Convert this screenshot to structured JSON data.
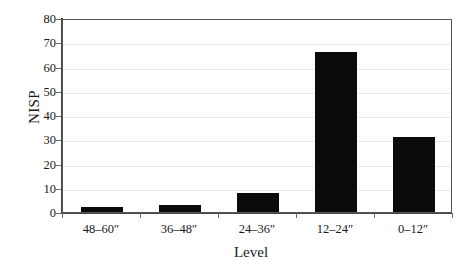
{
  "chart_data": {
    "type": "bar",
    "title": "",
    "xlabel": "Level",
    "ylabel": "NISP",
    "categories": [
      "48–60″",
      "36–48″",
      "24–36″",
      "12–24″",
      "0–12″"
    ],
    "values": [
      2,
      3,
      8,
      66,
      31
    ],
    "ylim": [
      0,
      80
    ],
    "ytick_labels": [
      "0",
      "10",
      "20",
      "30",
      "40",
      "50",
      "60",
      "70",
      "80"
    ],
    "ytick_values": [
      0,
      10,
      20,
      30,
      40,
      50,
      60,
      70,
      80
    ],
    "grid": true,
    "legend": false,
    "bar_color": "#0b0b0b",
    "grid_color": "#e9e9e9",
    "axis_color": "#4a4a4a",
    "background_color": "#ffffff"
  }
}
